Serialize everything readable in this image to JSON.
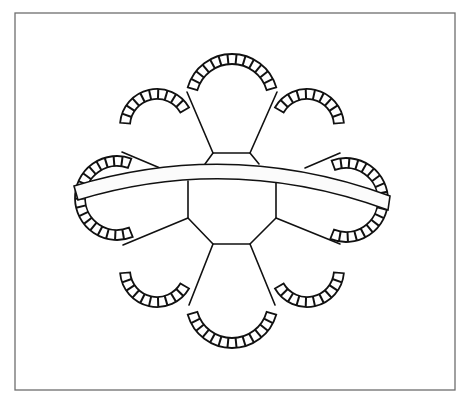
{
  "figure": {
    "colors": {
      "background": "#ffffff",
      "frame": "#6e6e6e",
      "line": "#111111",
      "band_fill": "#fbfbfb"
    },
    "lobe_count": 8,
    "lobes": [
      {
        "name": "top",
        "cx": 232,
        "cy": 100,
        "r": 46,
        "start": 196,
        "end": 344
      },
      {
        "name": "top-right",
        "cx": 307,
        "cy": 126,
        "r": 37,
        "start": 210,
        "end": 355
      },
      {
        "name": "right",
        "cx": 346,
        "cy": 200,
        "r": 42,
        "start": 250,
        "end": 112
      },
      {
        "name": "bottom-right",
        "cx": 307,
        "cy": 270,
        "r": 37,
        "start": 5,
        "end": 150
      },
      {
        "name": "bottom",
        "cx": 232,
        "cy": 302,
        "r": 46,
        "start": 16,
        "end": 164
      },
      {
        "name": "bottom-left",
        "cx": 157,
        "cy": 270,
        "r": 37,
        "start": 30,
        "end": 175
      },
      {
        "name": "left",
        "cx": 117,
        "cy": 198,
        "r": 42,
        "start": 68,
        "end": 290
      },
      {
        "name": "top-left",
        "cx": 157,
        "cy": 126,
        "r": 37,
        "start": 185,
        "end": 330
      }
    ]
  }
}
